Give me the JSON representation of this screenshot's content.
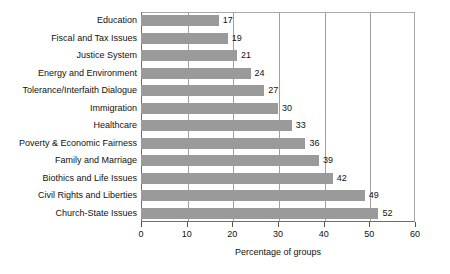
{
  "chart_data": {
    "type": "bar",
    "orientation": "horizontal",
    "title": "",
    "xlabel": "Percentage of groups",
    "ylabel": "",
    "xlim": [
      0,
      60
    ],
    "xticks": [
      0,
      10,
      20,
      30,
      40,
      50,
      60
    ],
    "grid": "vertical",
    "legend": "none",
    "show_data_labels": true,
    "bar_color": "#9a9a9a",
    "categories": [
      "Education",
      "Fiscal and Tax Issues",
      "Justice System",
      "Energy and Environment",
      "Tolerance/Interfaith Dialogue",
      "Immigration",
      "Healthcare",
      "Poverty & Economic Fairness",
      "Family and Marriage",
      "Biothics and Life Issues",
      "Civil Rights and Liberties",
      "Church-State Issues"
    ],
    "values": [
      17,
      19,
      21,
      24,
      27,
      30,
      33,
      36,
      39,
      42,
      49,
      52
    ]
  }
}
